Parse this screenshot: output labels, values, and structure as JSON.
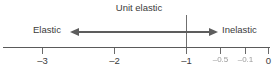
{
  "diagram": {
    "type": "elasticity-number-line",
    "unit_elastic_label": "Unit elastic",
    "region_left_label": "Elastic",
    "region_right_label": "Inelastic",
    "axis": {
      "min": -3.5,
      "max": 0.1,
      "unit_elastic_value": -1,
      "ticks": [
        {
          "value": -3,
          "label": "–3",
          "faint": false,
          "x": 42
        },
        {
          "value": -2,
          "label": "–2",
          "faint": false,
          "x": 114
        },
        {
          "value": -1,
          "label": "–1",
          "faint": false,
          "x": 186
        },
        {
          "value": -0.5,
          "label": "–0.5",
          "faint": true,
          "x": 220
        },
        {
          "value": -0.1,
          "label": "–0.1",
          "faint": true,
          "x": 245
        },
        {
          "value": 0,
          "label": "0",
          "faint": false,
          "x": 268
        }
      ]
    },
    "arrow": {
      "direction": "double",
      "left_head": "arrow-head-left",
      "right_head": "arrow-head-right"
    },
    "colors": {
      "background": "#ffffff",
      "ink": "#3b3b3b",
      "line": "#5a5a5a",
      "arrow": "#5d5d5d",
      "faint_ink": "#9a9a9a"
    }
  }
}
